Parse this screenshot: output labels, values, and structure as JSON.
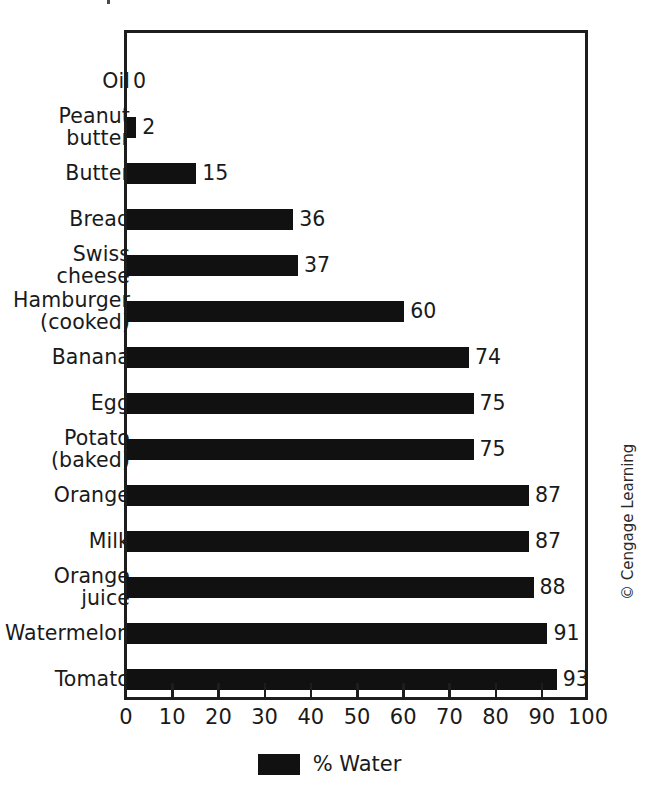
{
  "chart_data": {
    "type": "bar",
    "orientation": "horizontal",
    "title": "",
    "xlabel": "",
    "ylabel": "",
    "xlim": [
      0,
      100
    ],
    "xticks": [
      0,
      10,
      20,
      30,
      40,
      50,
      60,
      70,
      80,
      90,
      100
    ],
    "grid": false,
    "legend_position": "bottom-center",
    "series": [
      {
        "name": "% Water",
        "color": "#111111",
        "values": [
          0,
          2,
          15,
          36,
          37,
          60,
          74,
          75,
          75,
          87,
          87,
          88,
          91,
          93
        ]
      }
    ],
    "categories": [
      "Oil",
      "Peanut\nbutter",
      "Butter",
      "Bread",
      "Swiss\ncheese",
      "Hamburger\n(cooked)",
      "Banana",
      "Egg",
      "Potato\n(baked)",
      "Orange",
      "Milk",
      "Orange\njuice",
      "Watermelon",
      "Tomato"
    ],
    "data_labels": [
      "0",
      "2",
      "15",
      "36",
      "37",
      "60",
      "74",
      "75",
      "75",
      "87",
      "87",
      "88",
      "91",
      "93"
    ],
    "tick_labels": [
      "0",
      "10",
      "20",
      "30",
      "40",
      "50",
      "60",
      "70",
      "80",
      "90",
      "100"
    ]
  },
  "legend": {
    "entries": [
      {
        "label": "% Water",
        "color": "#111111"
      }
    ]
  },
  "credit": {
    "text": "© Cengage Learning"
  },
  "colors": {
    "bar": "#111111",
    "axis": "#1d1d1d",
    "text": "#1a1a1a",
    "background": "#ffffff"
  }
}
